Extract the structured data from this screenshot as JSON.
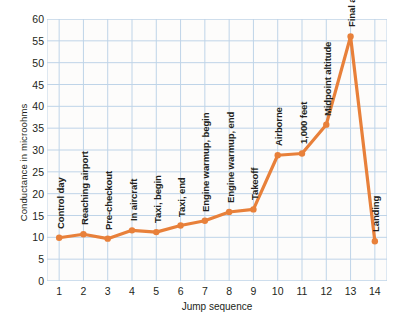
{
  "chart_data": {
    "type": "line",
    "title": "",
    "xlabel": "Jump sequence",
    "ylabel": "Conductance in microohms",
    "xlim": [
      0.5,
      14.5
    ],
    "ylim": [
      0,
      60
    ],
    "yticks": [
      0,
      5,
      10,
      15,
      20,
      25,
      30,
      35,
      40,
      45,
      50,
      55,
      60
    ],
    "xticks": [
      1,
      2,
      3,
      4,
      5,
      6,
      7,
      8,
      9,
      10,
      11,
      12,
      13,
      14
    ],
    "grid": true,
    "legend": "none",
    "line_color": "#E8803A",
    "grid_color": "#BFD4E8",
    "x": [
      1,
      2,
      3,
      4,
      5,
      6,
      7,
      8,
      9,
      10,
      11,
      12,
      13,
      14
    ],
    "values": [
      9.9,
      10.7,
      9.7,
      11.6,
      11.2,
      12.7,
      13.8,
      15.8,
      16.4,
      28.8,
      29.2,
      35.8,
      56.0,
      9.1
    ],
    "point_labels": [
      "Control day",
      "Reaching airport",
      "Pre-checkout",
      "In aircraft",
      "Taxi, begin",
      "Taxi, end",
      "Engine warmup, begin",
      "Engine warmup, end",
      "Takeoff",
      "Airborne",
      "1,000 feet",
      "Midpoint altitude",
      "Final altitude",
      "Landing"
    ]
  }
}
